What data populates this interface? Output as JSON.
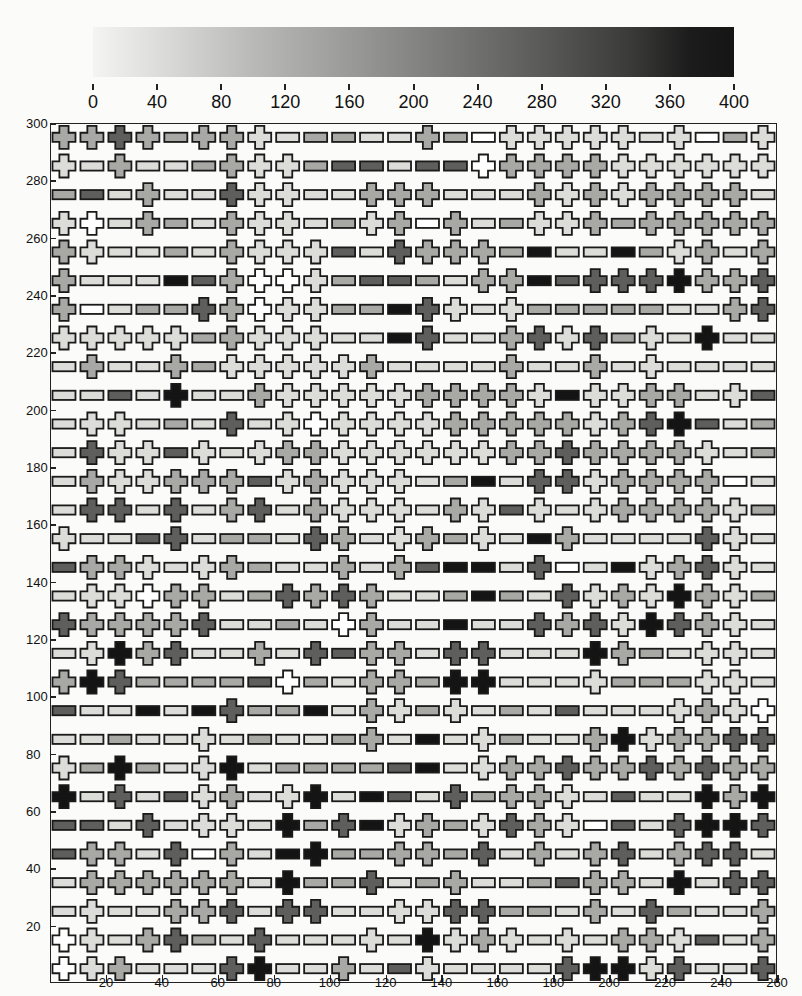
{
  "colorbar": {
    "ticks": [
      "0",
      "40",
      "80",
      "120",
      "160",
      "200",
      "240",
      "280",
      "320",
      "360",
      "400"
    ],
    "range": [
      0,
      400
    ]
  },
  "axes": {
    "x_ticks": [
      "20",
      "40",
      "60",
      "80",
      "100",
      "120",
      "140",
      "160",
      "180",
      "200",
      "220",
      "240",
      "260"
    ],
    "y_ticks": [
      "20",
      "40",
      "60",
      "80",
      "100",
      "120",
      "140",
      "160",
      "180",
      "200",
      "220",
      "240",
      "260",
      "280",
      "300"
    ]
  },
  "chart_data": {
    "type": "heatmap",
    "title": "",
    "xlabel": "",
    "ylabel": "",
    "xlim": [
      0,
      260
    ],
    "ylim": [
      0,
      300
    ],
    "grid": false,
    "colorbar": {
      "min": 0,
      "max": 400,
      "ticks": [
        0,
        40,
        80,
        120,
        160,
        200,
        240,
        280,
        320,
        360,
        400
      ],
      "position": "top"
    },
    "cell_size": 10,
    "x_centers": [
      5,
      15,
      25,
      35,
      45,
      55,
      65,
      75,
      85,
      95,
      105,
      115,
      125,
      135,
      145,
      155,
      165,
      175,
      185,
      195,
      205,
      215,
      225,
      235,
      245,
      255
    ],
    "y_centers_top_to_bottom": [
      295,
      285,
      275,
      265,
      255,
      245,
      235,
      225,
      215,
      205,
      195,
      185,
      175,
      165,
      155,
      145,
      135,
      125,
      115,
      105,
      95,
      85,
      75,
      65,
      55,
      45,
      35,
      25,
      15,
      5
    ],
    "encoding": "Each cell = glyph shape (C = cross, B = horizontal bar) + shade level 0-4 (0 = white/~0, 1 = light/~80, 2 = medium/~160, 3 = dark/~260, 4 = black/~380)",
    "rows": [
      "C2 C2 C3 C2 B2 C2 C2 C1 B1 B2 B2 B1 B1 C2 B2 B0 C1 C1 C1 C1 C1 B1 C1 B0 B2 C1",
      "C1 B1 C2 B1 B1 B2 C2 C1 C1 B2 B3 B3 B1 B3 B3 C0 C2 C2 C2 C2 C1 C1 C1 C1 C1 C1",
      "B2 B3 B1 C2 B1 B1 C3 C1 C1 B1 B1 C2 C2 C2 B1 B1 B1 C2 C1 C2 C1 C2 C2 C2 C2 B1",
      "C1 C0 B1 C2 B2 B1 C2 C1 C1 B1 B2 C1 C2 B0 C2 B1 B2 C1 C1 C2 B2 C2 C2 C2 C2 C2",
      "C2 C1 B1 B1 B2 B1 C2 C1 C1 C1 B3 B1 C3 C2 C2 C2 B2 B4 B1 B1 B4 B2 C1 C2 B1 C2",
      "C2 B1 B1 B1 B4 B3 C2 C0 C0 C1 B2 B3 B3 B2 B1 C2 C2 B4 B3 C3 C3 C3 C4 C2 C2 C3",
      "C2 B0 B1 B2 B2 C3 C2 C0 C1 C1 B2 B2 B4 C3 C1 B1 C1 B2 B2 B2 B2 B2 B1 B1 C2 C3",
      "C1 C1 C1 C1 C1 B2 C2 C1 C1 C1 B1 B1 B4 C3 B1 B1 C2 C3 C1 C3 B2 C1 B1 C4 B1 B1",
      "B1 C2 B1 B1 C2 B2 C1 C1 C1 C1 C1 C2 B1 B1 B1 B1 C2 B1 B1 C2 B1 C1 B1 B1 B1 B1",
      "B1 B1 B3 B1 C4 B1 B1 C2 C1 C1 C1 C1 C1 C2 C2 C2 C2 C1 B4 C1 C1 C2 C2 B1 C1 B3",
      "B1 C1 C1 B1 B2 B1 C3 B1 C1 C0 C1 C1 C1 C1 C2 C2 C2 C2 C2 C1 C2 C3 C4 B3 B1 B2",
      "B1 C3 C1 C1 B3 C1 B1 C1 C2 C2 C1 C1 C1 C1 C1 C1 C2 C2 C3 C2 C2 C2 C2 C1 B1 B2",
      "B1 C2 C1 C1 C2 C2 C2 B3 C1 C2 C1 C1 C1 B1 B2 B4 B1 C3 C3 C1 C2 C2 C2 C2 B0 B1",
      "B1 C3 C3 B1 C3 B1 C2 C3 B1 C2 C1 C1 C1 B1 C2 C1 B3 C1 B1 C1 C2 C2 C2 C2 C1 B2",
      "C1 B1 B1 B3 C3 B1 B2 B2 B1 C3 C2 B1 C1 C2 B2 C1 B1 B4 C2 B1 B1 B1 B1 C3 C1 B1",
      "B3 C2 C2 C1 B1 C1 C2 B2 B1 B1 C2 B1 C2 B3 B4 B4 B1 C3 B0 B1 B4 C1 C2 C3 C1 B1",
      "B1 C1 C1 C0 C2 C2 B1 B2 C3 C2 C3 C2 B1 B1 B2 B4 B2 B1 C3 C1 C2 C1 C4 C2 C1 B2",
      "C3 C2 C2 C2 C2 C3 B1 B1 B2 B1 C0 C2 B1 B1 B4 B1 B1 C3 C2 C3 C1 C4 C3 C2 C1 B1",
      "B1 C1 C4 C2 C3 B1 B1 C2 B1 C3 B3 C2 C2 B1 C3 C3 B1 B1 B1 C4 C2 B2 B1 C1 C1 B1",
      "C2 C4 C3 B2 B2 B2 B2 B3 C0 B2 B1 C2 C2 B2 C4 C4 B1 B1 B1 C1 B2 B2 B2 C1 C1 B1",
      "B3 B1 B1 B4 B1 B4 C3 B2 B2 B4 B1 C2 C1 B2 C1 B1 B2 B1 B3 B1 B1 B1 C1 C2 C1 C0",
      "B1 B1 B2 B1 B1 C1 B1 B2 B1 B1 B2 C2 B1 B4 B1 C1 B2 B1 B1 C2 C4 C1 C2 C2 C3 C3",
      "C1 B2 C4 B2 B1 C1 C4 B1 B2 B2 B2 B2 B3 B4 B1 C1 C2 C2 C3 C2 C2 C3 C2 C3 C2 C2",
      "C4 B1 C3 B1 B3 C1 C2 B1 C1 C4 B1 B4 B3 B1 C3 B2 C2 C2 C1 B1 B3 B1 B1 C4 C2 C4",
      "B3 B3 B1 C3 B1 C1 C1 B1 C4 B2 C3 B4 C1 C2 B2 C1 C3 C2 C1 B0 B3 B1 C3 C4 C4 C3",
      "B3 C2 C2 B1 C3 B0 C2 B1 B4 C4 B2 B2 C2 C2 B2 C3 B1 C2 B1 C2 C3 B1 C2 C3 C3 B1",
      "B1 C2 C2 C2 C2 C2 C2 B1 C4 B2 B2 C3 B1 B2 C2 B1 B1 B2 B3 C2 C2 B1 C4 B1 C3 C3",
      "B1 C1 B1 B1 C2 C2 C3 B1 C3 C3 B1 B1 C1 C1 C3 C3 B2 B2 B1 C2 B1 C3 B2 B1 B1 C2",
      "C0 C1 B1 C2 C3 B2 B1 C3 B1 B1 B1 C1 B1 C4 C1 C2 C1 B1 C1 B1 C2 C2 C1 B3 B1 C2",
      "C0 C1 C2 B1 B1 B1 C3 C4 B1 B1 C2 B1 B3 C1 B1 B1 B1 B1 C3 C4 C4 C1 C3 B1 B1 C3"
    ],
    "shade_colors": [
      "#ffffff",
      "#dcdcd8",
      "#a8a8a4",
      "#5e5e5c",
      "#141414"
    ]
  }
}
